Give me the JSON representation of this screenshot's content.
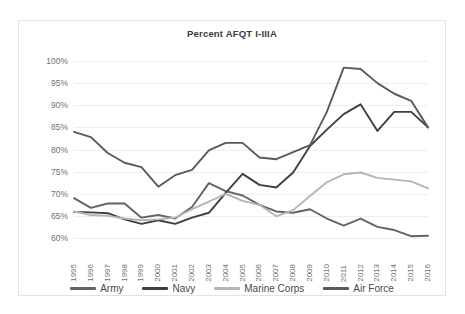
{
  "chart_data": {
    "type": "line",
    "title": "Percent AFQT I-IIIA",
    "xlabel": "",
    "ylabel": "",
    "ylim": [
      60,
      100
    ],
    "yticks": [
      60,
      65,
      70,
      75,
      80,
      85,
      90,
      95,
      100
    ],
    "ytick_labels": [
      "60%",
      "65%",
      "70%",
      "75%",
      "80%",
      "85%",
      "90%",
      "95%",
      "100%"
    ],
    "grid": true,
    "legend_position": "bottom",
    "categories": [
      1995,
      1996,
      1997,
      1998,
      1999,
      2000,
      2001,
      2002,
      2003,
      2004,
      2005,
      2006,
      2007,
      2008,
      2009,
      2010,
      2011,
      2012,
      2013,
      2014,
      2015,
      2016
    ],
    "x": [
      "1995",
      "1996",
      "1997",
      "1998",
      "1999",
      "2000",
      "2001",
      "2002",
      "2003",
      "2004",
      "2005",
      "2006",
      "2007",
      "2008",
      "2009",
      "2010",
      "2011",
      "2012",
      "2013",
      "2014",
      "2015",
      "2016"
    ],
    "series": [
      {
        "name": "Army",
        "color": "#636363",
        "values": [
          69.0,
          66.8,
          67.8,
          67.8,
          64.6,
          65.2,
          64.4,
          67.0,
          72.4,
          70.6,
          69.6,
          67.5,
          66.0,
          65.7,
          66.5,
          64.4,
          62.8,
          64.4,
          62.5,
          61.8,
          60.4,
          60.5
        ]
      },
      {
        "name": "Navy",
        "color": "#3f3f3f",
        "values": [
          65.9,
          65.8,
          65.6,
          64.2,
          63.2,
          64.0,
          63.2,
          64.6,
          65.7,
          70.2,
          74.5,
          72.0,
          71.4,
          74.8,
          80.8,
          84.5,
          88.0,
          90.2,
          84.2,
          88.5,
          88.5,
          85.0
        ]
      },
      {
        "name": "Marine Corps",
        "color": "#b5b5b5",
        "values": [
          66.0,
          65.2,
          65.0,
          64.4,
          64.0,
          64.2,
          64.6,
          66.5,
          68.2,
          70.0,
          68.4,
          67.5,
          64.9,
          66.3,
          69.5,
          72.6,
          74.4,
          74.8,
          73.6,
          73.2,
          72.8,
          71.2
        ]
      },
      {
        "name": "Air Force",
        "color": "#5a5a5a",
        "values": [
          84.0,
          82.8,
          79.2,
          77.0,
          76.0,
          71.6,
          74.2,
          75.4,
          79.8,
          81.5,
          81.5,
          78.2,
          77.8,
          79.4,
          81.0,
          88.5,
          98.5,
          98.2,
          95.0,
          92.6,
          91.0,
          85.0
        ]
      }
    ]
  }
}
